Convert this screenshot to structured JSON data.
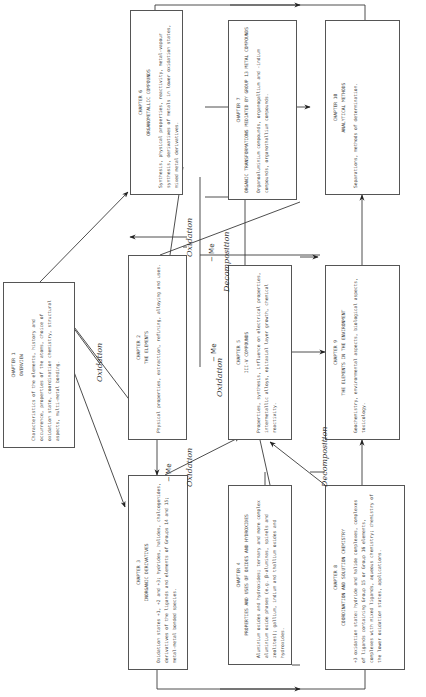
{
  "chapters": {
    "ch1": {
      "chapter": "CHAPTER 1",
      "title": "OVERVIEW",
      "text": "Characteristics of the elements, history and occurrence, properties of the atoms, choice of oxidation state, coordination chemistry, structural aspects, multi-metal bonding."
    },
    "ch2": {
      "chapter": "CHAPTER 2",
      "title": "THE ELEMENTS",
      "text": "Physical properties, extraction, refining, alloying and uses."
    },
    "ch3": {
      "chapter": "CHAPTER 3",
      "title": "INORGANIC DERIVATIVES",
      "text": "Oxidation states +1, +2 and +3; hydrides, halides, chalcogenides, derivatives of the ligands and elements of Groups 14 and 15; metal-metal bonded species."
    },
    "ch4": {
      "chapter": "CHAPTER 4",
      "title": "PROPERTIES AND USES OF OXIDES AND HYDROXIDES",
      "text": "Aluminium oxides and hydroxides; ternary and more complex aluminium oxide phases (e.g. β-aluminas, spinels and zeolites); gallium, indium and thallium oxides and hydroxides."
    },
    "ch5": {
      "chapter": "CHAPTER 5",
      "title": "III-V COMPOUNDS",
      "text": "Properties, synthesis, influence on electrical properties, intermetallic alloys, epitaxial layer growth, chemical reactivity."
    },
    "ch6": {
      "chapter": "CHAPTER 6",
      "title": "ORGANOMETALLIC COMPOUNDS",
      "text": "Synthesis, physical properties, reactivity, metal-vapour synthesis, derivatives of metals in lower oxidation states, mixed metal derivatives."
    },
    "ch7": {
      "chapter": "CHAPTER 7",
      "title": "ORGANIC TRANSFORMATIONS MEDIATED BY GROUP 13 METAL COMPOUNDS",
      "text": "Organoaluminium compounds, organogallium and -indium compounds, organothallium compounds."
    },
    "ch8": {
      "chapter": "CHAPTER 8",
      "title": "COORDINATION AND SOLUTION CHEMISTRY",
      "text": "+3 oxidation state: hydride and halide complexes, complexes of ligands containing Group 15 or Group 16 elements, complexes with mixed ligands, aqueous chemistry; chemistry of the lower oxidation states, applications."
    },
    "ch9": {
      "chapter": "CHAPTER 9",
      "title": "THE ELEMENTS IN THE ENVIRONMENT",
      "text": "Geochemistry, environmental aspects, biological aspects, toxicology."
    },
    "ch10": {
      "chapter": "CHAPTER 10",
      "title": "ANALYTICAL METHODS",
      "text": "Separations, methods of determination."
    }
  },
  "labels": {
    "oxidation": "Oxidation",
    "decomposition": "Decomposition",
    "minus_me": "− Me"
  },
  "colors": {
    "line": "#3a3a3a",
    "box_border": "#555555",
    "text": "#444444"
  }
}
